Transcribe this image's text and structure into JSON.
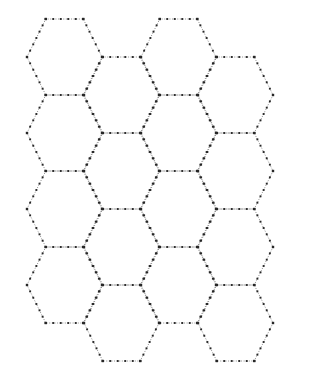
{
  "canvas": {
    "width": 311,
    "height": 380,
    "background_color": "#ffffff",
    "title": "Hexagonal Honeycomb Grid"
  },
  "style": {
    "line_color": "#8a8a8a",
    "line_color_faint": "#b8b8b8",
    "dot_color": "#262626",
    "line_width": 0.9,
    "dash_pattern": "1.1 1.5",
    "dot_size": 1.9,
    "dot_spacing": 7.5
  },
  "grid": {
    "type": "honeycomb",
    "orientation": "flat-top",
    "columns": 4,
    "rows": 4,
    "hex_width": 75,
    "hex_height": 76,
    "horizontal_pitch": 57,
    "vertical_pitch": 76,
    "column_vertical_offset": 38,
    "origin_x": 27,
    "origin_y": 19,
    "total_cells": 16,
    "description": "Four staggered columns of dotted-outline hexagons forming a honeycomb tiling"
  },
  "cells": [
    {
      "id": "c0r0",
      "col": 0,
      "row": 0,
      "cx": 64.5,
      "cy": 57
    },
    {
      "id": "c0r1",
      "col": 0,
      "row": 1,
      "cx": 64.5,
      "cy": 133
    },
    {
      "id": "c0r2",
      "col": 0,
      "row": 2,
      "cx": 64.5,
      "cy": 209
    },
    {
      "id": "c0r3",
      "col": 0,
      "row": 3,
      "cx": 64.5,
      "cy": 285
    },
    {
      "id": "c1r0",
      "col": 1,
      "row": 0,
      "cx": 121.5,
      "cy": 95
    },
    {
      "id": "c1r1",
      "col": 1,
      "row": 1,
      "cx": 121.5,
      "cy": 171
    },
    {
      "id": "c1r2",
      "col": 1,
      "row": 2,
      "cx": 121.5,
      "cy": 247
    },
    {
      "id": "c1r3",
      "col": 1,
      "row": 3,
      "cx": 121.5,
      "cy": 323
    },
    {
      "id": "c2r0",
      "col": 2,
      "row": 0,
      "cx": 178.5,
      "cy": 57
    },
    {
      "id": "c2r1",
      "col": 2,
      "row": 1,
      "cx": 178.5,
      "cy": 133
    },
    {
      "id": "c2r2",
      "col": 2,
      "row": 2,
      "cx": 178.5,
      "cy": 209
    },
    {
      "id": "c2r3",
      "col": 2,
      "row": 3,
      "cx": 178.5,
      "cy": 285
    },
    {
      "id": "c3r0",
      "col": 3,
      "row": 0,
      "cx": 235.5,
      "cy": 95
    },
    {
      "id": "c3r1",
      "col": 3,
      "row": 1,
      "cx": 235.5,
      "cy": 171
    },
    {
      "id": "c3r2",
      "col": 3,
      "row": 2,
      "cx": 235.5,
      "cy": 247
    },
    {
      "id": "c3r3",
      "col": 3,
      "row": 3,
      "cx": 235.5,
      "cy": 323
    }
  ]
}
